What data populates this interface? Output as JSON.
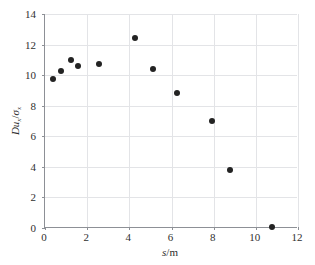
{
  "chart_data": {
    "type": "scatter",
    "title": "",
    "xlabel": "s/m",
    "ylabel": "Du_x/σ_x",
    "xlabel_parts": {
      "symbol": "s",
      "slash": "/",
      "unit": "m"
    },
    "ylabel_parts": {
      "d": "D",
      "u": "u",
      "u_sub": "x",
      "slash": "/",
      "sigma": "σ",
      "sigma_sub": "x"
    },
    "xlim": [
      0,
      12
    ],
    "ylim": [
      0,
      14
    ],
    "xticks": [
      0,
      2,
      4,
      6,
      8,
      10,
      12
    ],
    "yticks": [
      0,
      2,
      4,
      6,
      8,
      10,
      12,
      14
    ],
    "xtick_labels": [
      "0",
      "2",
      "4",
      "6",
      "8",
      "10",
      "12"
    ],
    "ytick_labels": [
      "0",
      "2",
      "4",
      "6",
      "8",
      "10",
      "12",
      "14"
    ],
    "grid": true,
    "legend": "none",
    "marker": {
      "shape": "circle",
      "color": "#232323",
      "size_px": 6
    },
    "points": [
      {
        "x": 0.38,
        "y": 9.75
      },
      {
        "x": 0.78,
        "y": 10.3
      },
      {
        "x": 1.22,
        "y": 11.0
      },
      {
        "x": 1.58,
        "y": 10.6
      },
      {
        "x": 2.55,
        "y": 10.72
      },
      {
        "x": 4.28,
        "y": 12.45
      },
      {
        "x": 5.1,
        "y": 10.4
      },
      {
        "x": 6.28,
        "y": 8.82
      },
      {
        "x": 7.9,
        "y": 6.98
      },
      {
        "x": 8.78,
        "y": 3.8
      },
      {
        "x": 10.75,
        "y": 0.05
      }
    ],
    "series": [
      {
        "name": "Du_x/σ_x vs s",
        "x": [
          0.38,
          0.78,
          1.22,
          1.58,
          2.55,
          4.28,
          5.1,
          6.28,
          7.9,
          8.78,
          10.75
        ],
        "values": [
          9.75,
          10.3,
          11.0,
          10.6,
          10.72,
          12.45,
          10.4,
          8.82,
          6.98,
          3.8,
          0.05
        ]
      }
    ]
  },
  "colors": {
    "background": "#ffffff",
    "axis": "#8d9096",
    "grid": "#e3e4e7",
    "marker": "#232323",
    "text": "#2f2f2f"
  }
}
